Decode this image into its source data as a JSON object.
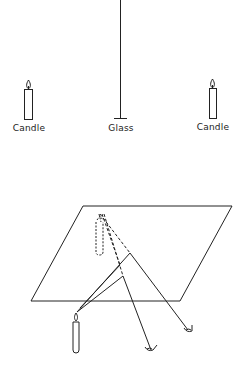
{
  "top_diagram": {
    "labels": {
      "left_candle": "Candle",
      "glass": "Glass",
      "right_candle": "Candle"
    }
  },
  "bottom_diagram": {
    "description": "Perspective view of glass plane with candle, virtual image (dashed), and two eyes viewing reflections"
  },
  "colors": {
    "line": "#222222",
    "background": "#ffffff"
  }
}
